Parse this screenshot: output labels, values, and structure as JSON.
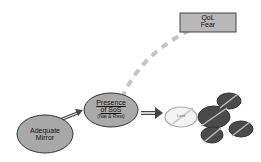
{
  "nodes": {
    "qol_box": {
      "line1": "QoL",
      "line2": "Fear"
    },
    "presence": {
      "line1": "Presence",
      "line2": "of SoS",
      "line3": "(Nat & Rest)"
    },
    "mirror": {
      "line1": "Adequate",
      "line2": "Mirror"
    },
    "loss_oval": {
      "label": "Loss"
    }
  },
  "colors": {
    "oval_fill": "#a9a9a9",
    "dark_oval": "#4a4a4a",
    "box_fill": "#b5b5b5",
    "dash": "#c0c0c0"
  }
}
